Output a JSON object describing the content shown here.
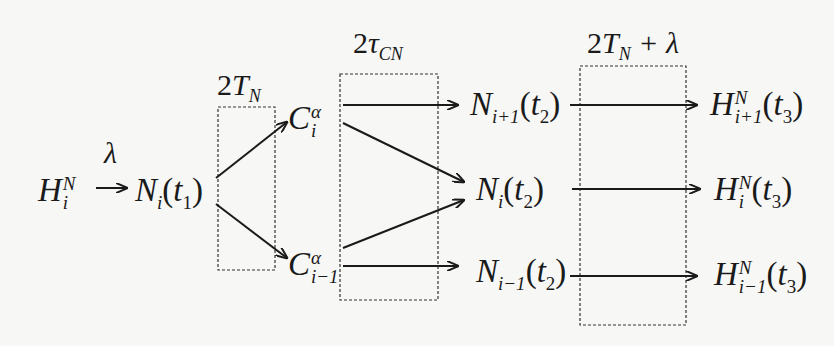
{
  "diagram": {
    "nodes": {
      "h_i": {
        "base": "H",
        "sup": "N",
        "sub": "i",
        "arg": ""
      },
      "n_i_t1": {
        "base": "N",
        "sub": "i",
        "arg": "t",
        "arg_sub": "1"
      },
      "c_i": {
        "base": "C",
        "sup": "α",
        "sub": "i"
      },
      "c_i_minus_1": {
        "base": "C",
        "sup": "α",
        "sub": "i−1"
      },
      "n_i_plus_1_t2": {
        "base": "N",
        "sub": "i+1",
        "arg": "t",
        "arg_sub": "2"
      },
      "n_i_t2": {
        "base": "N",
        "sub": "i",
        "arg": "t",
        "arg_sub": "2"
      },
      "n_i_minus_1_t2": {
        "base": "N",
        "sub": "i−1",
        "arg": "t",
        "arg_sub": "2"
      },
      "h_i_plus_1_t3": {
        "base": "H",
        "sup": "N",
        "sub": "i+1",
        "arg": "t",
        "arg_sub": "3"
      },
      "h_i_t3": {
        "base": "H",
        "sup": "N",
        "sub": "i",
        "arg": "t",
        "arg_sub": "3"
      },
      "h_i_minus_1_t3": {
        "base": "H",
        "sup": "N",
        "sub": "i−1",
        "arg": "t",
        "arg_sub": "3"
      }
    },
    "labels": {
      "lambda": "λ",
      "box1": {
        "pre": "2",
        "var": "T",
        "sub": "N",
        "post": ""
      },
      "box2": {
        "pre": "2",
        "var": "τ",
        "sub": "CN",
        "post": ""
      },
      "box3": {
        "pre": "2",
        "var": "T",
        "sub": "N",
        "post": " + λ"
      }
    },
    "edges": [
      {
        "from": "h_i",
        "to": "n_i_t1",
        "label": "λ"
      },
      {
        "from": "n_i_t1",
        "to": "c_i"
      },
      {
        "from": "n_i_t1",
        "to": "c_i_minus_1"
      },
      {
        "from": "c_i",
        "to": "n_i_plus_1_t2"
      },
      {
        "from": "c_i",
        "to": "n_i_t2"
      },
      {
        "from": "c_i_minus_1",
        "to": "n_i_t2"
      },
      {
        "from": "c_i_minus_1",
        "to": "n_i_minus_1_t2"
      },
      {
        "from": "n_i_plus_1_t2",
        "to": "h_i_plus_1_t3"
      },
      {
        "from": "n_i_t2",
        "to": "h_i_t3"
      },
      {
        "from": "n_i_minus_1_t2",
        "to": "h_i_minus_1_t3"
      }
    ],
    "colors": {
      "ink": "#1a1a1a",
      "background": "#f7f7f5"
    }
  }
}
